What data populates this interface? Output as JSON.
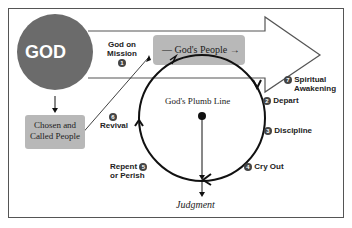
{
  "diagram": {
    "god_label": "GOD",
    "mission_label_line1": "God on",
    "mission_label_line2": "Mission",
    "mission_number": "1",
    "gods_people_label": "— God's People →",
    "chosen_line1": "Chosen and",
    "chosen_line2": "Called People",
    "plumb_line_label": "God's Plumb Line",
    "judgment_label": "Judgment",
    "steps": [
      {
        "number": "2",
        "label": "Depart"
      },
      {
        "number": "3",
        "label": "Discipline"
      },
      {
        "number": "4",
        "label": "Cry Out"
      },
      {
        "number": "5",
        "label_line1": "Repent",
        "label_line2": "or Perish"
      },
      {
        "number": "6",
        "label": "Revival"
      },
      {
        "number": "7",
        "label_line1": "Spiritual",
        "label_line2": "Awakening"
      }
    ],
    "colors": {
      "god_circle": "#6b6b6b",
      "box_fill": "#b8b8b8",
      "line": "#111111"
    }
  }
}
